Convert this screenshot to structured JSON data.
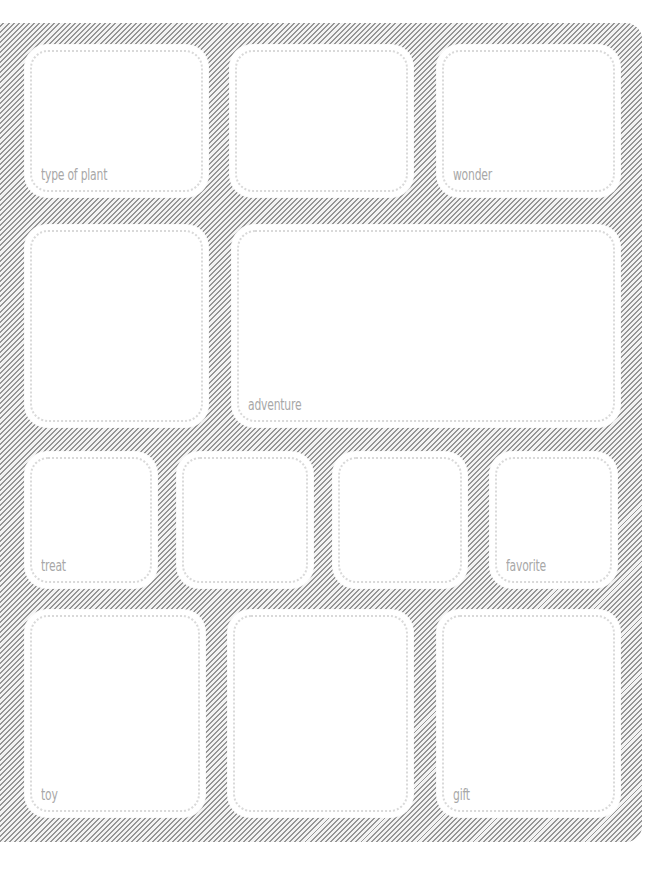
{
  "worksheet": {
    "background_pattern": "diagonal-hatch",
    "colors": {
      "hatch_line": "#8e8e8e",
      "hatch_gap": "#f2f2f2",
      "box_fill": "#ffffff",
      "dotted_border": "#d9d9d9",
      "label_text": "#a8a8a8"
    },
    "rows": [
      {
        "boxes": [
          {
            "label": "type of plant"
          },
          {
            "label": ""
          },
          {
            "label": "wonder"
          }
        ]
      },
      {
        "boxes": [
          {
            "label": ""
          },
          {
            "label": "adventure"
          }
        ]
      },
      {
        "boxes": [
          {
            "label": "treat"
          },
          {
            "label": ""
          },
          {
            "label": ""
          },
          {
            "label": "favorite"
          }
        ]
      },
      {
        "boxes": [
          {
            "label": "toy"
          },
          {
            "label": ""
          },
          {
            "label": "gift"
          }
        ]
      }
    ]
  }
}
